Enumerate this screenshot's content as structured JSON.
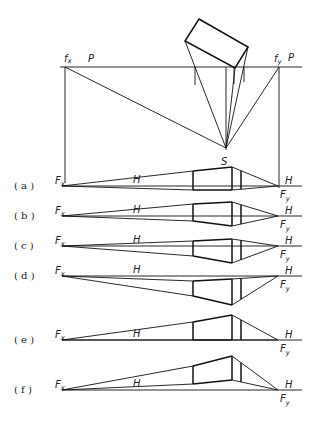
{
  "figure": {
    "plan": {
      "left_point": "f",
      "left_point_sub": "x",
      "right_point": "f",
      "right_point_sub": "y",
      "picture_plane_left": "P",
      "picture_plane_right": "P",
      "station_point": "S"
    },
    "rows": [
      {
        "label": "( a )",
        "fx": "F",
        "fx_sub": "x",
        "h_mid": "H",
        "h_right": "H",
        "fy": "F",
        "fy_sub": "y"
      },
      {
        "label": "( b )",
        "fx": "F",
        "fx_sub": "x",
        "h_mid": "H",
        "h_right": "H",
        "fy": "F",
        "fy_sub": "y"
      },
      {
        "label": "( c )",
        "fx": "F",
        "fx_sub": "x",
        "h_mid": "H",
        "h_right": "H",
        "fy": "F",
        "fy_sub": "y"
      },
      {
        "label": "( d )",
        "fx": "F",
        "fx_sub": "x",
        "h_mid": "H",
        "h_right": "H",
        "fy": "F",
        "fy_sub": "y"
      },
      {
        "label": "( e )",
        "fx": "F",
        "fx_sub": "x",
        "h_mid": "H",
        "h_right": "H",
        "fy": "F",
        "fy_sub": "y"
      },
      {
        "label": "( f )",
        "fx": "F",
        "fx_sub": "x",
        "h_mid": "H",
        "h_right": "H",
        "fy": "F",
        "fy_sub": "y"
      }
    ]
  }
}
